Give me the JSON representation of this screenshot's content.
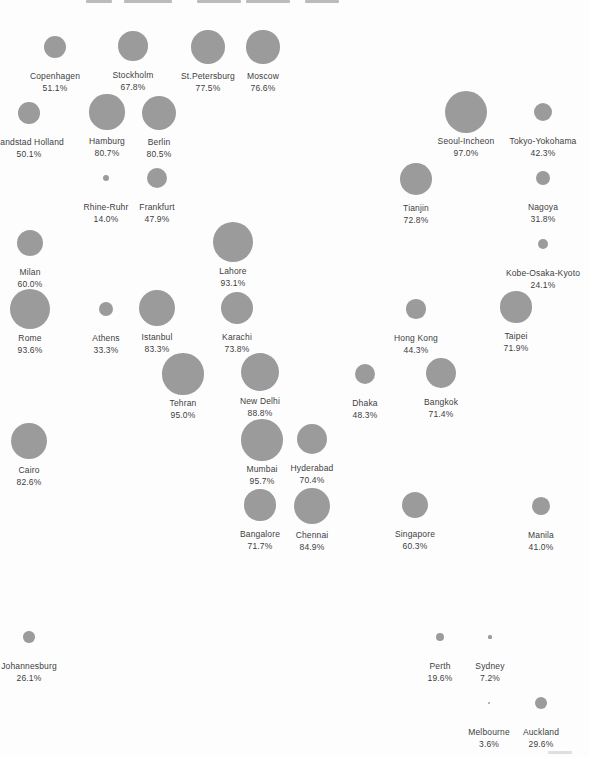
{
  "page": {
    "background_color": "#fdfdfd"
  },
  "chart_data": {
    "type": "bubble",
    "title": "",
    "value_suffix": "%",
    "bubble_color": "#9b9b9b",
    "label_color": "#3d3d3d",
    "radius_per_unit": 0.217,
    "min_radius": 1.1,
    "label_offset_y": 23,
    "points": [
      {
        "label": "Copenhagen",
        "value": 51.1,
        "x": 55,
        "y": 47
      },
      {
        "label": "Stockholm",
        "value": 67.8,
        "x": 133,
        "y": 46
      },
      {
        "label": "St.Petersburg",
        "value": 77.5,
        "x": 208,
        "y": 47
      },
      {
        "label": "Moscow",
        "value": 76.6,
        "x": 263,
        "y": 47
      },
      {
        "label": "Randstad Holland",
        "value": 50.1,
        "x": 29,
        "y": 113
      },
      {
        "label": "Hamburg",
        "value": 80.7,
        "x": 107,
        "y": 112
      },
      {
        "label": "Berlin",
        "value": 80.5,
        "x": 159,
        "y": 113
      },
      {
        "label": "Seoul-Incheon",
        "value": 97.0,
        "x": 466,
        "y": 112
      },
      {
        "label": "Tokyo-Yokohama",
        "value": 42.3,
        "x": 543,
        "y": 112
      },
      {
        "label": "Rhine-Ruhr",
        "value": 14.0,
        "x": 106,
        "y": 178
      },
      {
        "label": "Frankfurt",
        "value": 47.9,
        "x": 157,
        "y": 178
      },
      {
        "label": "Tianjin",
        "value": 72.8,
        "x": 416,
        "y": 179
      },
      {
        "label": "Nagoya",
        "value": 31.8,
        "x": 543,
        "y": 178
      },
      {
        "label": "Milan",
        "value": 60.0,
        "x": 30,
        "y": 243
      },
      {
        "label": "Lahore",
        "value": 93.1,
        "x": 233,
        "y": 242
      },
      {
        "label": "Kobe-Osaka-Kyoto",
        "value": 24.1,
        "x": 543,
        "y": 244
      },
      {
        "label": "Rome",
        "value": 93.6,
        "x": 30,
        "y": 309
      },
      {
        "label": "Athens",
        "value": 33.3,
        "x": 106,
        "y": 309
      },
      {
        "label": "Istanbul",
        "value": 83.3,
        "x": 157,
        "y": 308
      },
      {
        "label": "Karachi",
        "value": 73.8,
        "x": 237,
        "y": 308
      },
      {
        "label": "Hong Kong",
        "value": 44.3,
        "x": 416,
        "y": 309
      },
      {
        "label": "Taipei",
        "value": 71.9,
        "x": 516,
        "y": 307
      },
      {
        "label": "Tehran",
        "value": 95.0,
        "x": 183,
        "y": 374
      },
      {
        "label": "New Delhi",
        "value": 88.8,
        "x": 260,
        "y": 372
      },
      {
        "label": "Dhaka",
        "value": 48.3,
        "x": 365,
        "y": 374
      },
      {
        "label": "Bangkok",
        "value": 71.4,
        "x": 441,
        "y": 373
      },
      {
        "label": "Cairo",
        "value": 82.6,
        "x": 29,
        "y": 441
      },
      {
        "label": "Mumbai",
        "value": 95.7,
        "x": 262,
        "y": 440
      },
      {
        "label": "Hyderabad",
        "value": 70.4,
        "x": 312,
        "y": 439
      },
      {
        "label": "Bangalore",
        "value": 71.7,
        "x": 260,
        "y": 505
      },
      {
        "label": "Chennai",
        "value": 84.9,
        "x": 312,
        "y": 506
      },
      {
        "label": "Singapore",
        "value": 60.3,
        "x": 415,
        "y": 505
      },
      {
        "label": "Manila",
        "value": 41.0,
        "x": 541,
        "y": 506
      },
      {
        "label": "Johannesburg",
        "value": 26.1,
        "x": 29,
        "y": 637
      },
      {
        "label": "Perth",
        "value": 19.6,
        "x": 440,
        "y": 637
      },
      {
        "label": "Sydney",
        "value": 7.2,
        "x": 490,
        "y": 637
      },
      {
        "label": "Melbourne",
        "value": 3.6,
        "x": 489,
        "y": 703
      },
      {
        "label": "Auckland",
        "value": 29.6,
        "x": 541,
        "y": 703
      }
    ]
  },
  "artifacts": {
    "top_cropped_text_fragments": [
      {
        "x": 86,
        "y": 0,
        "w": 26,
        "h": 3
      },
      {
        "x": 124,
        "y": 0,
        "w": 48,
        "h": 3
      },
      {
        "x": 197,
        "y": 0,
        "w": 44,
        "h": 3
      },
      {
        "x": 246,
        "y": 0,
        "w": 44,
        "h": 3
      },
      {
        "x": 305,
        "y": 0,
        "w": 34,
        "h": 3
      }
    ],
    "bottom_right_smudge": {
      "x": 548,
      "y": 751,
      "w": 24,
      "h": 3
    }
  }
}
